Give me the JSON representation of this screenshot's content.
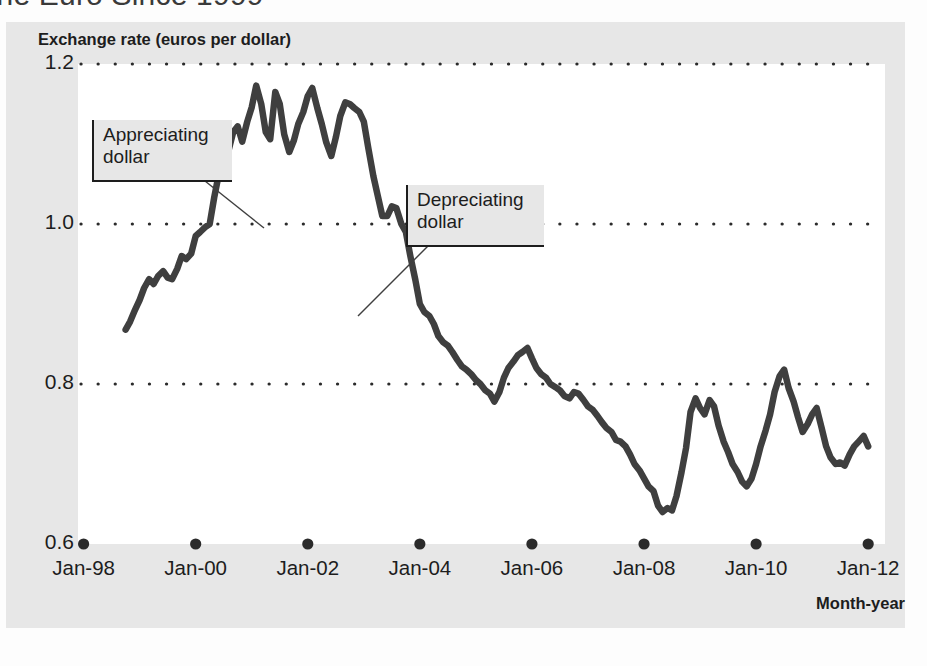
{
  "figure": {
    "title": "the Euro Since 1999",
    "panel_color": "#e7e7e7",
    "plot_background": "#ffffff",
    "series_color": "#3f3f3f"
  },
  "annotations": [
    {
      "name": "appreciating-dollar",
      "line1": "Appreciating",
      "line2": "dollar"
    },
    {
      "name": "depreciating-dollar",
      "line1": "Depreciating",
      "line2": "dollar"
    }
  ],
  "chart_data": {
    "type": "line",
    "title": "the Euro Since 1999",
    "xlabel": "Month-year",
    "ylabel": "Exchange rate (euros per dollar)",
    "grid": true,
    "legend": null,
    "xlim": [
      1997.9,
      2012.3
    ],
    "ylim": [
      0.6,
      1.2
    ],
    "yticks": [
      "1.2",
      "1.0",
      "0.8",
      "0.6"
    ],
    "ytick_values": [
      1.2,
      1.0,
      0.8,
      0.6
    ],
    "xticks": [
      "Jan-98",
      "Jan-00",
      "Jan-02",
      "Jan-04",
      "Jan-06",
      "Jan-08",
      "Jan-10",
      "Jan-12"
    ],
    "xtick_values": [
      1998.0,
      2000.0,
      2002.0,
      2004.0,
      2006.0,
      2008.0,
      2010.0,
      2012.0
    ],
    "series": [
      {
        "name": "Euros per dollar",
        "x": [
          1998.75,
          1998.83,
          1998.92,
          1999.0,
          1999.08,
          1999.17,
          1999.25,
          1999.33,
          1999.42,
          1999.5,
          1999.58,
          1999.67,
          1999.75,
          1999.83,
          1999.92,
          2000.0,
          2000.08,
          2000.17,
          2000.25,
          2000.33,
          2000.42,
          2000.5,
          2000.58,
          2000.67,
          2000.75,
          2000.83,
          2000.92,
          2001.0,
          2001.08,
          2001.17,
          2001.25,
          2001.33,
          2001.42,
          2001.5,
          2001.58,
          2001.67,
          2001.75,
          2001.83,
          2001.92,
          2002.0,
          2002.08,
          2002.17,
          2002.25,
          2002.33,
          2002.42,
          2002.5,
          2002.58,
          2002.67,
          2002.75,
          2002.83,
          2002.92,
          2003.0,
          2003.08,
          2003.17,
          2003.25,
          2003.33,
          2003.42,
          2003.5,
          2003.58,
          2003.67,
          2003.75,
          2003.83,
          2003.92,
          2004.0,
          2004.08,
          2004.17,
          2004.25,
          2004.33,
          2004.42,
          2004.5,
          2004.58,
          2004.67,
          2004.75,
          2004.83,
          2004.92,
          2005.0,
          2005.08,
          2005.17,
          2005.25,
          2005.33,
          2005.42,
          2005.5,
          2005.58,
          2005.67,
          2005.75,
          2005.83,
          2005.92,
          2006.0,
          2006.08,
          2006.17,
          2006.25,
          2006.33,
          2006.42,
          2006.5,
          2006.58,
          2006.67,
          2006.75,
          2006.83,
          2006.92,
          2007.0,
          2007.08,
          2007.17,
          2007.25,
          2007.33,
          2007.42,
          2007.5,
          2007.58,
          2007.67,
          2007.75,
          2007.83,
          2007.92,
          2008.0,
          2008.08,
          2008.17,
          2008.25,
          2008.33,
          2008.42,
          2008.5,
          2008.58,
          2008.67,
          2008.75,
          2008.83,
          2008.92,
          2009.0,
          2009.08,
          2009.17,
          2009.25,
          2009.33,
          2009.42,
          2009.5,
          2009.58,
          2009.67,
          2009.75,
          2009.83,
          2009.92,
          2010.0,
          2010.08,
          2010.17,
          2010.25,
          2010.33,
          2010.42,
          2010.5,
          2010.58,
          2010.67,
          2010.75,
          2010.83,
          2010.92,
          2011.0,
          2011.08,
          2011.17,
          2011.25,
          2011.33,
          2011.42,
          2011.5,
          2011.58,
          2011.67,
          2011.75,
          2011.83,
          2011.92,
          2012.0
        ],
        "y": [
          0.868,
          0.878,
          0.893,
          0.905,
          0.92,
          0.931,
          0.925,
          0.935,
          0.941,
          0.933,
          0.931,
          0.944,
          0.96,
          0.956,
          0.963,
          0.985,
          0.99,
          0.996,
          1.0,
          1.033,
          1.065,
          1.057,
          1.09,
          1.115,
          1.122,
          1.103,
          1.128,
          1.146,
          1.173,
          1.15,
          1.115,
          1.106,
          1.165,
          1.15,
          1.112,
          1.09,
          1.104,
          1.125,
          1.14,
          1.16,
          1.17,
          1.145,
          1.125,
          1.102,
          1.085,
          1.108,
          1.135,
          1.152,
          1.15,
          1.145,
          1.14,
          1.128,
          1.095,
          1.06,
          1.035,
          1.01,
          1.01,
          1.022,
          1.02,
          1.0,
          0.99,
          0.96,
          0.93,
          0.9,
          0.89,
          0.885,
          0.875,
          0.86,
          0.852,
          0.848,
          0.84,
          0.83,
          0.822,
          0.818,
          0.812,
          0.805,
          0.8,
          0.792,
          0.788,
          0.778,
          0.79,
          0.808,
          0.82,
          0.828,
          0.836,
          0.84,
          0.845,
          0.832,
          0.82,
          0.812,
          0.808,
          0.8,
          0.796,
          0.792,
          0.785,
          0.782,
          0.79,
          0.788,
          0.78,
          0.772,
          0.768,
          0.76,
          0.752,
          0.745,
          0.74,
          0.73,
          0.728,
          0.722,
          0.712,
          0.7,
          0.692,
          0.682,
          0.672,
          0.666,
          0.648,
          0.64,
          0.645,
          0.642,
          0.66,
          0.69,
          0.72,
          0.765,
          0.782,
          0.77,
          0.762,
          0.78,
          0.772,
          0.748,
          0.728,
          0.715,
          0.7,
          0.69,
          0.678,
          0.672,
          0.682,
          0.7,
          0.722,
          0.742,
          0.762,
          0.79,
          0.81,
          0.818,
          0.795,
          0.778,
          0.758,
          0.74,
          0.75,
          0.762,
          0.77,
          0.745,
          0.722,
          0.708,
          0.7,
          0.702,
          0.698,
          0.712,
          0.722,
          0.728,
          0.735,
          0.722
        ]
      }
    ]
  }
}
